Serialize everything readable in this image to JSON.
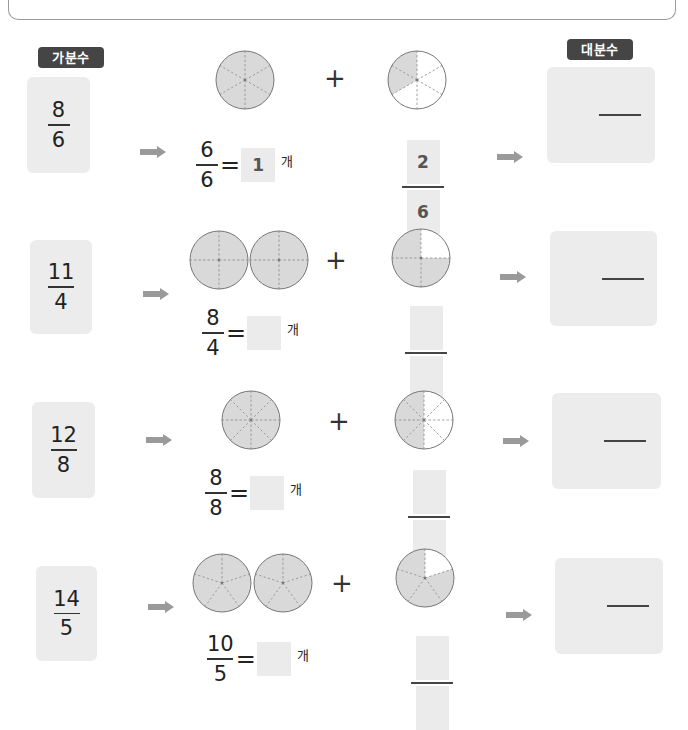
{
  "headers": {
    "improper_label": "가분수",
    "mixed_label": "대분수"
  },
  "colors": {
    "badge_bg": "#454545",
    "card_bg": "#ececec",
    "shade": "#d9d9d9",
    "arrow": "#9a9a9a"
  },
  "unit": "개",
  "rows": [
    {
      "improper": {
        "num": "8",
        "den": "6"
      },
      "whole_circles": 1,
      "parts": 6,
      "partial_shaded": 2,
      "eq": {
        "num": "6",
        "den": "6",
        "answer": "1"
      },
      "remainder": {
        "num": "2",
        "den": "6"
      },
      "mixed": {
        "whole": "",
        "num": "",
        "den": ""
      }
    },
    {
      "improper": {
        "num": "11",
        "den": "4"
      },
      "whole_circles": 2,
      "parts": 4,
      "partial_shaded": 3,
      "eq": {
        "num": "8",
        "den": "4",
        "answer": ""
      },
      "remainder": {
        "num": "",
        "den": ""
      },
      "mixed": {
        "whole": "",
        "num": "",
        "den": ""
      }
    },
    {
      "improper": {
        "num": "12",
        "den": "8"
      },
      "whole_circles": 1,
      "parts": 8,
      "partial_shaded": 4,
      "eq": {
        "num": "8",
        "den": "8",
        "answer": ""
      },
      "remainder": {
        "num": "",
        "den": ""
      },
      "mixed": {
        "whole": "",
        "num": "",
        "den": ""
      }
    },
    {
      "improper": {
        "num": "14",
        "den": "5"
      },
      "whole_circles": 2,
      "parts": 5,
      "partial_shaded": 4,
      "eq": {
        "num": "10",
        "den": "5",
        "answer": ""
      },
      "remainder": {
        "num": "",
        "den": ""
      },
      "mixed": {
        "whole": "",
        "num": "",
        "den": ""
      }
    }
  ]
}
